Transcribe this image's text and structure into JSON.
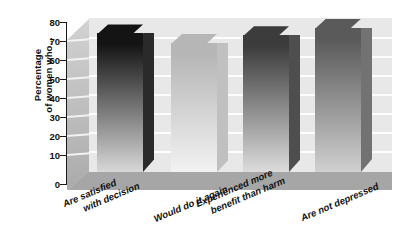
{
  "chart_data": {
    "type": "bar",
    "title": "",
    "subtitle": "",
    "xlabel": "",
    "ylabel": "Percentage of women who...",
    "ylabel_lines": [
      "Percentage",
      "of women who..."
    ],
    "categories": [
      "Are satisfied with decision",
      "Would do it again",
      "Experienced more benefit than harm",
      "Are not depressed"
    ],
    "category_lines": [
      [
        "Are satisfied",
        "with decision"
      ],
      [
        "Would do it again"
      ],
      [
        "Experienced more",
        "benefit than harm"
      ],
      [
        "Are not depressed"
      ]
    ],
    "values": [
      72,
      67,
      71,
      75
    ],
    "ylim": [
      0,
      80
    ],
    "ytick_labels": [
      "80",
      "70",
      "60",
      "50",
      "40",
      "30",
      "20",
      "10",
      "0"
    ],
    "ytick_values": [
      80,
      70,
      60,
      50,
      40,
      30,
      20,
      10,
      0
    ],
    "ytick_step": 10,
    "grid": true,
    "grid_axis": "y",
    "legend": false,
    "legend_position": "none",
    "style": "3d-bar-grayscale",
    "bar_colors": [
      "#1c1c1c",
      "#c8c8c8",
      "#4a4a4a",
      "#6e6e6e"
    ],
    "bar_gradients": [
      [
        "#141414",
        "#d8d8d8"
      ],
      [
        "#b6b6b6",
        "#f2f2f2"
      ],
      [
        "#3c3c3c",
        "#dcdcdc"
      ],
      [
        "#5a5a5a",
        "#d0d0d0"
      ]
    ]
  },
  "plot": {
    "background_color": "#e8e8e8",
    "floor_color": "#a6a6a6",
    "gridline_color": "#fdfdfd",
    "axis_color": "#1a1a1a"
  }
}
